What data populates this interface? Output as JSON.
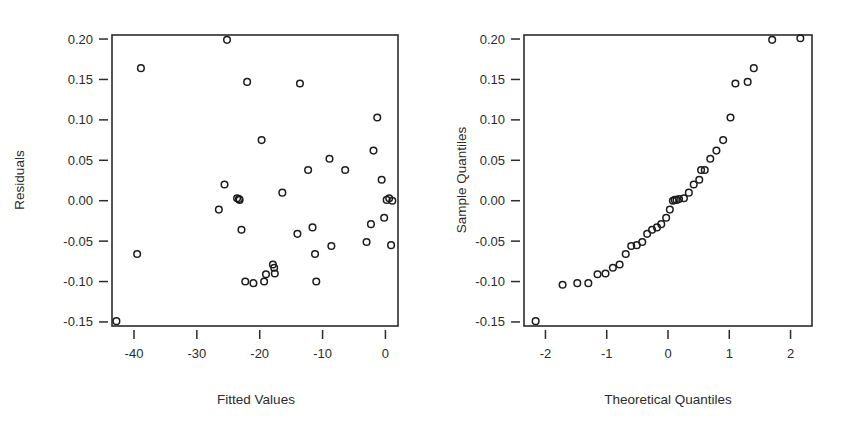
{
  "figure": {
    "background": "#ffffff",
    "ink": "#2b2b2b",
    "point_color": "#1c1c1c",
    "point_style": "open-circle"
  },
  "chart_data": [
    {
      "id": "residuals-vs-fitted",
      "type": "scatter",
      "title": "",
      "xlabel": "Fitted Values",
      "ylabel": "Residuals",
      "xlim": [
        -43.5,
        2.0
      ],
      "ylim": [
        -0.155,
        0.205
      ],
      "xticks": [
        -40,
        -30,
        -20,
        -10,
        0
      ],
      "xticklabels": [
        "-40",
        "-30",
        "-20",
        "-10",
        "0"
      ],
      "yticks": [
        -0.15,
        -0.1,
        -0.05,
        0.0,
        0.05,
        0.1,
        0.15,
        0.2
      ],
      "yticklabels": [
        "-0.15",
        "-0.10",
        "-0.05",
        "0.00",
        "0.05",
        "0.10",
        "0.15",
        "0.20"
      ],
      "grid": false,
      "legend": "none",
      "x": [
        -42.8,
        -38.9,
        -39.5,
        -26.5,
        -25.6,
        -25.2,
        -23.6,
        -23.3,
        -23.2,
        -22.9,
        -22.3,
        -22.0,
        -21.0,
        -19.7,
        -19.3,
        -19.0,
        -17.9,
        -17.7,
        -17.6,
        -16.4,
        -14.0,
        -13.6,
        -12.3,
        -11.6,
        -11.2,
        -11.0,
        -8.9,
        -8.6,
        -6.4,
        -3.0,
        -2.3,
        -1.9,
        -1.3,
        -0.6,
        -0.2,
        0.2,
        0.6,
        0.9,
        1.1
      ],
      "y": [
        -0.149,
        0.164,
        -0.066,
        -0.011,
        0.02,
        0.199,
        0.003,
        0.002,
        0.001,
        -0.036,
        -0.1,
        0.147,
        -0.102,
        0.075,
        -0.1,
        -0.091,
        -0.079,
        -0.083,
        -0.09,
        0.01,
        -0.041,
        0.145,
        0.038,
        -0.033,
        -0.066,
        -0.1,
        0.052,
        -0.056,
        0.038,
        -0.051,
        -0.029,
        0.062,
        0.103,
        0.026,
        -0.021,
        0.001,
        0.003,
        -0.055,
        0.0
      ]
    },
    {
      "id": "normal-qq",
      "type": "scatter",
      "title": "",
      "xlabel": "Theoretical Quantiles",
      "ylabel": "Sample Quantiles",
      "xlim": [
        -2.35,
        2.35
      ],
      "ylim": [
        -0.155,
        0.205
      ],
      "xticks": [
        -2,
        -1,
        0,
        1,
        2
      ],
      "xticklabels": [
        "-2",
        "-1",
        "0",
        "1",
        "2"
      ],
      "yticks": [
        -0.15,
        -0.1,
        -0.05,
        0.0,
        0.05,
        0.1,
        0.15,
        0.2
      ],
      "yticklabels": [
        "-0.15",
        "-0.10",
        "-0.05",
        "0.00",
        "0.05",
        "0.10",
        "0.15",
        "0.20"
      ],
      "grid": false,
      "legend": "none",
      "x": [
        -2.16,
        -1.72,
        -1.48,
        -1.3,
        -1.15,
        -1.02,
        -0.9,
        -0.79,
        -0.69,
        -0.6,
        -0.51,
        -0.42,
        -0.34,
        -0.26,
        -0.18,
        -0.11,
        -0.03,
        0.03,
        0.08,
        0.11,
        0.14,
        0.18,
        0.26,
        0.34,
        0.42,
        0.51,
        0.54,
        0.6,
        0.69,
        0.79,
        0.9,
        1.02,
        1.1,
        1.3,
        1.4,
        1.7,
        2.16
      ],
      "y": [
        -0.149,
        -0.104,
        -0.102,
        -0.102,
        -0.091,
        -0.09,
        -0.083,
        -0.079,
        -0.066,
        -0.056,
        -0.055,
        -0.051,
        -0.041,
        -0.036,
        -0.033,
        -0.029,
        -0.021,
        -0.011,
        0.0,
        0.001,
        0.001,
        0.002,
        0.003,
        0.01,
        0.02,
        0.026,
        0.038,
        0.038,
        0.052,
        0.062,
        0.075,
        0.103,
        0.145,
        0.147,
        0.164,
        0.199,
        0.201
      ]
    }
  ]
}
